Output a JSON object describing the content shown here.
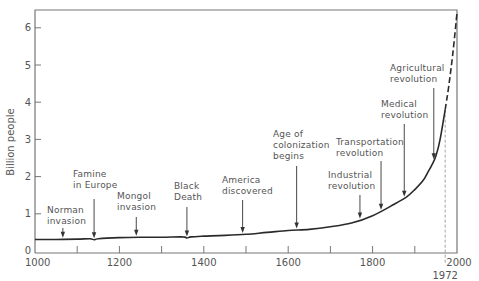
{
  "chart_data": {
    "type": "line",
    "title": "",
    "xlabel": "",
    "ylabel": "Billion people",
    "xlim": [
      1000,
      2000
    ],
    "ylim": [
      0,
      6.5
    ],
    "grid": false,
    "legend": null,
    "x_ticks": [
      1000,
      1100,
      1200,
      1300,
      1400,
      1500,
      1600,
      1700,
      1800,
      1900,
      2000
    ],
    "x_tick_labels": [
      "1000",
      "",
      "1200",
      "",
      "1400",
      "",
      "1600",
      "",
      "1800",
      "",
      "2000"
    ],
    "y_ticks": [
      0,
      1,
      2,
      3,
      4,
      5,
      6
    ],
    "y_tick_labels": [
      "0",
      "1",
      "2",
      "3",
      "4",
      "5",
      "6"
    ],
    "reference_line": {
      "x": 1972,
      "label": "1972",
      "style": "dashed"
    },
    "series": [
      {
        "name": "World population (historical)",
        "style": "solid",
        "x": [
          1000,
          1050,
          1100,
          1130,
          1140,
          1150,
          1200,
          1250,
          1300,
          1350,
          1360,
          1370,
          1400,
          1450,
          1500,
          1550,
          1600,
          1650,
          1700,
          1750,
          1800,
          1850,
          1880,
          1900,
          1920,
          1930,
          1940,
          1950,
          1960,
          1972
        ],
        "values": [
          0.31,
          0.31,
          0.32,
          0.33,
          0.3,
          0.33,
          0.36,
          0.37,
          0.37,
          0.38,
          0.35,
          0.38,
          0.4,
          0.42,
          0.45,
          0.5,
          0.55,
          0.58,
          0.65,
          0.75,
          0.95,
          1.25,
          1.45,
          1.65,
          1.9,
          2.1,
          2.3,
          2.55,
          3.0,
          3.8
        ]
      },
      {
        "name": "Projection",
        "style": "dashed",
        "x": [
          1972,
          1980,
          1990,
          2000
        ],
        "values": [
          3.8,
          4.4,
          5.3,
          6.4
        ]
      }
    ],
    "annotations": [
      {
        "label": "Norman invasion",
        "lines": [
          "Norman",
          "invasion"
        ],
        "year": 1066
      },
      {
        "label": "Famine in Europe",
        "lines": [
          "Famine",
          "in Europe"
        ],
        "year": 1140
      },
      {
        "label": "Mongol invasion",
        "lines": [
          "Mongol",
          "invasion"
        ],
        "year": 1240
      },
      {
        "label": "Black Death",
        "lines": [
          "Black",
          "Death"
        ],
        "year": 1360
      },
      {
        "label": "America discovered",
        "lines": [
          "America",
          "discovered"
        ],
        "year": 1492
      },
      {
        "label": "Age of colonization begins",
        "lines": [
          "Age of",
          "colonization",
          "begins"
        ],
        "year": 1620
      },
      {
        "label": "Industrial revolution",
        "lines": [
          "Industrial",
          "revolution"
        ],
        "year": 1770
      },
      {
        "label": "Transportation revolution",
        "lines": [
          "Transportation",
          "revolution"
        ],
        "year": 1820
      },
      {
        "label": "Medical revolution",
        "lines": [
          "Medical",
          "revolution"
        ],
        "year": 1875
      },
      {
        "label": "Agricultural revolution",
        "lines": [
          "Agricultural",
          "revolution"
        ],
        "year": 1945
      }
    ]
  },
  "colors": {
    "axis": "#777777",
    "line": "#2a2a2a",
    "text": "#555555"
  }
}
